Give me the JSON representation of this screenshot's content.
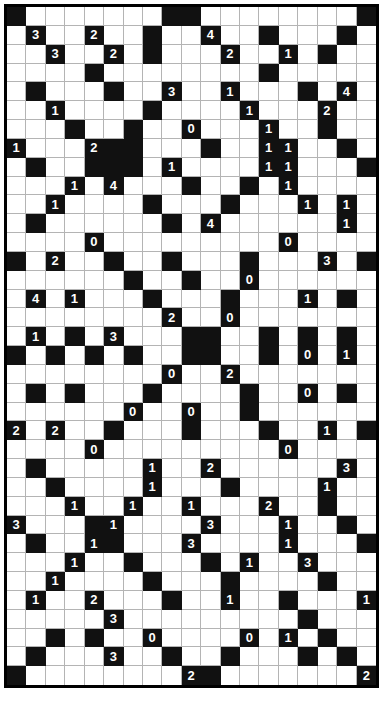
{
  "puzzle": {
    "type": "number-grid-puzzle",
    "columns": 19,
    "rows": 34,
    "colors": {
      "filled_cell": "#111111",
      "empty_cell": "#ffffff",
      "grid_line": "#b4b4b4",
      "border": "#000000",
      "filled_text": "#ffffff",
      "empty_text": "#000000"
    },
    "legend": {
      "filled": "black cell",
      "empty": "white cell",
      "clue": "number printed inside a black cell"
    },
    "cell_codes": {
      "0": "white empty cell",
      "1": "black empty cell",
      "digit": "black cell containing that digit"
    },
    "grid": [
      [
        1,
        0,
        0,
        0,
        0,
        0,
        0,
        0,
        1,
        1,
        0,
        0,
        0,
        0,
        0,
        0,
        0,
        0,
        1
      ],
      [
        0,
        "3",
        0,
        0,
        "2",
        0,
        0,
        1,
        0,
        0,
        "4",
        0,
        0,
        1,
        0,
        0,
        0,
        1,
        0
      ],
      [
        0,
        0,
        "3",
        0,
        0,
        "2",
        0,
        1,
        0,
        0,
        0,
        "2",
        0,
        0,
        "1",
        0,
        1,
        0,
        0
      ],
      [
        0,
        0,
        0,
        0,
        1,
        0,
        0,
        0,
        0,
        0,
        0,
        0,
        0,
        1,
        0,
        0,
        0,
        0,
        0
      ],
      [
        0,
        1,
        0,
        0,
        0,
        1,
        0,
        0,
        "3",
        0,
        0,
        "1",
        0,
        0,
        0,
        1,
        0,
        "4",
        0
      ],
      [
        0,
        0,
        "1",
        0,
        0,
        0,
        0,
        1,
        0,
        0,
        0,
        0,
        "1",
        0,
        0,
        0,
        "2",
        0,
        0
      ],
      [
        0,
        0,
        0,
        1,
        0,
        0,
        1,
        0,
        0,
        "0",
        0,
        0,
        0,
        "1",
        0,
        0,
        1,
        0,
        0
      ],
      [
        "1",
        0,
        0,
        0,
        "2",
        1,
        1,
        0,
        0,
        0,
        1,
        0,
        0,
        "1",
        "1",
        0,
        0,
        1,
        0
      ],
      [
        0,
        1,
        0,
        0,
        1,
        1,
        1,
        0,
        "1",
        0,
        0,
        0,
        0,
        "1",
        "1",
        0,
        0,
        0,
        1
      ],
      [
        0,
        0,
        0,
        "1",
        0,
        "4",
        0,
        0,
        0,
        1,
        0,
        0,
        1,
        0,
        "1",
        0,
        0,
        0,
        0
      ],
      [
        0,
        0,
        "1",
        0,
        0,
        0,
        0,
        1,
        0,
        0,
        0,
        1,
        0,
        0,
        0,
        "1",
        0,
        "1",
        0
      ],
      [
        0,
        1,
        0,
        0,
        0,
        0,
        0,
        0,
        1,
        0,
        "4",
        0,
        0,
        0,
        0,
        0,
        0,
        "1",
        0
      ],
      [
        0,
        0,
        0,
        0,
        "0",
        0,
        0,
        0,
        0,
        0,
        0,
        0,
        0,
        0,
        "0",
        0,
        0,
        0,
        0
      ],
      [
        1,
        0,
        "2",
        0,
        0,
        1,
        0,
        0,
        1,
        0,
        0,
        0,
        1,
        0,
        0,
        0,
        "3",
        0,
        1
      ],
      [
        0,
        0,
        0,
        0,
        0,
        0,
        1,
        0,
        0,
        1,
        0,
        0,
        "0",
        0,
        0,
        0,
        0,
        0,
        0
      ],
      [
        0,
        "4",
        0,
        "1",
        0,
        0,
        0,
        1,
        0,
        0,
        0,
        1,
        0,
        0,
        0,
        "1",
        0,
        1,
        0
      ],
      [
        0,
        0,
        0,
        0,
        0,
        0,
        0,
        0,
        "2",
        0,
        0,
        "0",
        0,
        0,
        0,
        0,
        0,
        0,
        0
      ],
      [
        0,
        "1",
        0,
        1,
        0,
        "3",
        0,
        0,
        0,
        1,
        1,
        0,
        0,
        1,
        0,
        1,
        0,
        1,
        0
      ],
      [
        1,
        0,
        1,
        0,
        1,
        0,
        1,
        0,
        0,
        1,
        1,
        0,
        0,
        1,
        0,
        "0",
        0,
        "1",
        0
      ],
      [
        0,
        0,
        0,
        0,
        0,
        0,
        0,
        0,
        "0",
        0,
        0,
        "2",
        0,
        0,
        0,
        0,
        0,
        0,
        0
      ],
      [
        0,
        1,
        0,
        1,
        0,
        0,
        0,
        1,
        0,
        0,
        0,
        0,
        1,
        0,
        0,
        "0",
        0,
        1,
        0
      ],
      [
        0,
        0,
        0,
        0,
        0,
        0,
        "0",
        0,
        0,
        "0",
        0,
        0,
        1,
        0,
        0,
        0,
        0,
        0,
        0
      ],
      [
        "2",
        0,
        "2",
        0,
        0,
        1,
        0,
        0,
        0,
        1,
        0,
        0,
        0,
        1,
        0,
        0,
        "1",
        0,
        1
      ],
      [
        0,
        0,
        0,
        0,
        "0",
        0,
        0,
        0,
        0,
        0,
        0,
        0,
        0,
        0,
        "0",
        0,
        0,
        0,
        0
      ],
      [
        0,
        1,
        0,
        0,
        0,
        0,
        0,
        "1",
        0,
        0,
        "2",
        0,
        0,
        0,
        0,
        0,
        0,
        "3",
        0
      ],
      [
        0,
        0,
        1,
        0,
        0,
        0,
        0,
        "1",
        0,
        0,
        0,
        1,
        0,
        0,
        0,
        0,
        "1",
        0,
        0
      ],
      [
        0,
        0,
        0,
        "1",
        0,
        0,
        "1",
        0,
        0,
        "1",
        0,
        0,
        0,
        "2",
        0,
        0,
        1,
        0,
        0
      ],
      [
        "3",
        0,
        0,
        0,
        1,
        "1",
        0,
        0,
        0,
        0,
        "3",
        0,
        0,
        0,
        "1",
        0,
        0,
        1,
        0
      ],
      [
        0,
        1,
        0,
        0,
        "1",
        1,
        0,
        0,
        0,
        "3",
        0,
        0,
        0,
        0,
        "1",
        0,
        0,
        0,
        1
      ],
      [
        0,
        0,
        0,
        "1",
        0,
        0,
        1,
        0,
        0,
        0,
        1,
        0,
        "1",
        0,
        0,
        "3",
        0,
        0,
        0
      ],
      [
        0,
        0,
        "1",
        0,
        0,
        0,
        0,
        1,
        0,
        0,
        0,
        1,
        0,
        0,
        0,
        0,
        1,
        0,
        0
      ],
      [
        0,
        "1",
        0,
        0,
        "2",
        0,
        0,
        0,
        1,
        0,
        0,
        "1",
        0,
        0,
        1,
        0,
        0,
        0,
        "1"
      ],
      [
        0,
        0,
        0,
        0,
        0,
        "3",
        0,
        0,
        0,
        0,
        0,
        0,
        0,
        0,
        0,
        1,
        0,
        0,
        0
      ],
      [
        0,
        0,
        1,
        0,
        1,
        0,
        0,
        "0",
        0,
        0,
        0,
        0,
        "0",
        0,
        "1",
        0,
        1,
        0,
        0
      ],
      [
        0,
        1,
        0,
        0,
        0,
        "3",
        0,
        0,
        1,
        0,
        0,
        1,
        0,
        0,
        0,
        1,
        0,
        1,
        0
      ],
      [
        1,
        0,
        0,
        0,
        0,
        0,
        0,
        0,
        0,
        "2",
        1,
        0,
        0,
        0,
        0,
        0,
        0,
        0,
        "2"
      ]
    ]
  }
}
